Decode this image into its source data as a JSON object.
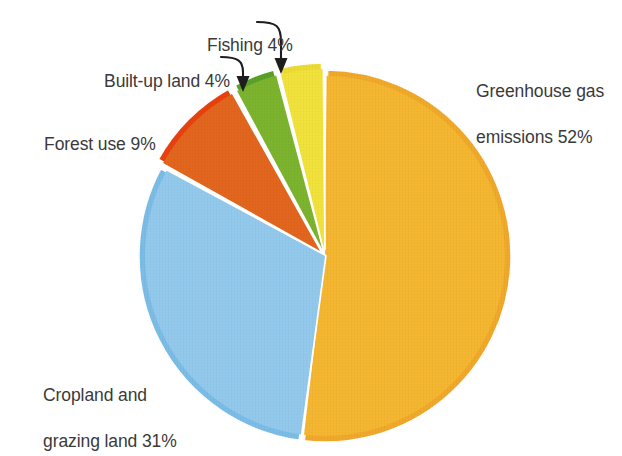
{
  "background_color": "#ffffff",
  "text_color": "#3a3a3a",
  "chart_data": {
    "type": "pie",
    "title": "",
    "subtitle": "",
    "xlabel": "",
    "ylabel": "",
    "legend_position": "none",
    "grid": false,
    "units": "percent",
    "total": 100,
    "center": {
      "x": 325,
      "y": 256
    },
    "radius": 187,
    "start_angle_deg": 0,
    "direction": "clockwise",
    "categories": [
      "Greenhouse gas emissions",
      "Cropland and grazing land",
      "Forest use",
      "Built-up land",
      "Fishing"
    ],
    "values": [
      52,
      31,
      9,
      4,
      4
    ],
    "colors": [
      "#f5b731",
      "#93c9ec",
      "#e2661e",
      "#7cb42e",
      "#f2e23c"
    ],
    "slices": [
      {
        "key": "greenhouse-gas-emissions",
        "name": "Greenhouse gas emissions",
        "value": 52,
        "percent_text": "52%",
        "color": "#f5b731",
        "rim_color": "#f0a92a",
        "exploded": false,
        "label_lines": [
          "Greenhouse gas",
          "emissions 52%"
        ],
        "label_full": "Greenhouse gas emissions 52%",
        "has_leader": false
      },
      {
        "key": "cropland-and-grazing-land",
        "name": "Cropland and grazing land",
        "value": 31,
        "percent_text": "31%",
        "color": "#93c9ec",
        "rim_color": "#7bbde6",
        "exploded": false,
        "label_lines": [
          "Cropland and",
          "grazing land 31%"
        ],
        "label_full": "Cropland and grazing land 31%",
        "has_leader": false
      },
      {
        "key": "forest-use",
        "name": "Forest use",
        "value": 9,
        "percent_text": "9%",
        "color": "#e2661e",
        "rim_color": "#e8410d",
        "exploded": true,
        "label_lines": [
          "Forest use 9%"
        ],
        "label_full": "Forest use 9%",
        "has_leader": false
      },
      {
        "key": "built-up-land",
        "name": "Built-up land",
        "value": 4,
        "percent_text": "4%",
        "color": "#7cb42e",
        "rim_color": "#59a12a",
        "exploded": true,
        "label_lines": [
          "Built-up land 4%"
        ],
        "label_full": "Built-up land 4%",
        "has_leader": true
      },
      {
        "key": "fishing",
        "name": "Fishing",
        "value": 4,
        "percent_text": "4%",
        "color": "#f2e23c",
        "rim_color": "#eddb33",
        "exploded": true,
        "label_lines": [
          "Fishing 4%"
        ],
        "label_full": "Fishing 4%",
        "has_leader": true
      }
    ],
    "annotations": [
      {
        "key": "fishing-leader",
        "target": "Fishing",
        "style": "curved-arrow-down"
      },
      {
        "key": "built-up-land-leader",
        "target": "Built-up land",
        "style": "curved-arrow-down"
      }
    ]
  },
  "labels": {
    "greenhouse": {
      "line1": "Greenhouse gas",
      "line2": "emissions 52%"
    },
    "cropland": {
      "line1": "Cropland and",
      "line2": "grazing land 31%"
    },
    "forest": {
      "line1": "Forest use 9%"
    },
    "builtup": {
      "line1": "Built-up land 4%"
    },
    "fishing": {
      "line1": "Fishing 4%"
    }
  }
}
